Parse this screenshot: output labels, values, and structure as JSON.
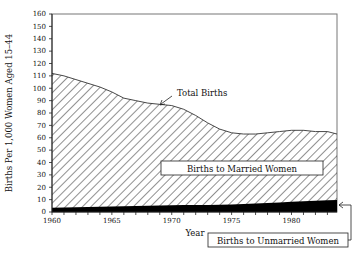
{
  "chart_data": {
    "type": "area",
    "title": "",
    "xlabel": "Year",
    "ylabel": "Births Per 1,000 Women Aged 15-44",
    "xlim": [
      1960,
      1983.8
    ],
    "ylim": [
      0,
      160
    ],
    "x_ticks": [
      1960,
      1965,
      1970,
      1975,
      1980
    ],
    "x_tick_labels": [
      "1960",
      "1965",
      "1970",
      "1975",
      "1980"
    ],
    "y_ticks": [
      0,
      10,
      20,
      30,
      40,
      50,
      60,
      70,
      80,
      90,
      100,
      110,
      120,
      130,
      140,
      150,
      160
    ],
    "y_tick_labels": [
      "0",
      "10",
      "20",
      "30",
      "40",
      "50",
      "60",
      "70",
      "80",
      "90",
      "100",
      "110",
      "120",
      "130",
      "140",
      "150",
      "160"
    ],
    "grid": false,
    "stacked": true,
    "x": [
      1960,
      1961,
      1962,
      1963,
      1964,
      1965,
      1966,
      1967,
      1968,
      1969,
      1970,
      1971,
      1972,
      1973,
      1974,
      1975,
      1976,
      1977,
      1978,
      1979,
      1980,
      1981,
      1982,
      1983,
      1983.8
    ],
    "series": [
      {
        "name": "Births to Unmarried Women",
        "fill": "solid-black",
        "values": [
          3.5,
          3.7,
          3.8,
          4.0,
          4.2,
          4.4,
          4.6,
          4.8,
          5.0,
          5.2,
          5.5,
          5.6,
          5.6,
          5.7,
          5.8,
          6.0,
          6.4,
          6.8,
          7.2,
          7.6,
          8.2,
          8.6,
          9.0,
          9.4,
          9.6
        ]
      },
      {
        "name": "Total Births",
        "fill": "diagonal-hatch (area above unmarried = Births to Married Women)",
        "values": [
          112,
          110,
          107,
          104,
          101,
          97,
          92,
          90,
          88,
          87,
          86,
          83,
          78,
          72,
          67,
          64,
          63,
          63,
          64,
          65,
          66,
          66,
          65,
          65,
          63
        ]
      }
    ],
    "annotations": [
      {
        "text": "Total Births",
        "points_to": "total births curve near 1969"
      },
      {
        "text": "Births to Married Women",
        "boxed": true,
        "region": "hatched area"
      },
      {
        "text": "Births to Unmarried Women",
        "boxed": true,
        "points_to": "solid black band at right edge"
      }
    ]
  },
  "labels": {
    "ylabel": "Births Per 1,000 Women Aged 15–44",
    "xlabel": "Year",
    "total": "Total Births",
    "married": "Births to Married Women",
    "unmarried": "Births to Unmarried Women"
  }
}
